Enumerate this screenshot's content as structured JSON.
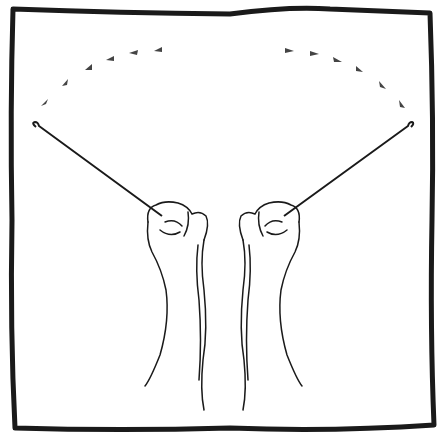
{
  "illustration": {
    "subject": "two fists holding crochet hooks with motion arcs",
    "colors": {
      "ink": "#1a1a1a",
      "background": "#ffffff",
      "arrow": "#444444"
    }
  }
}
